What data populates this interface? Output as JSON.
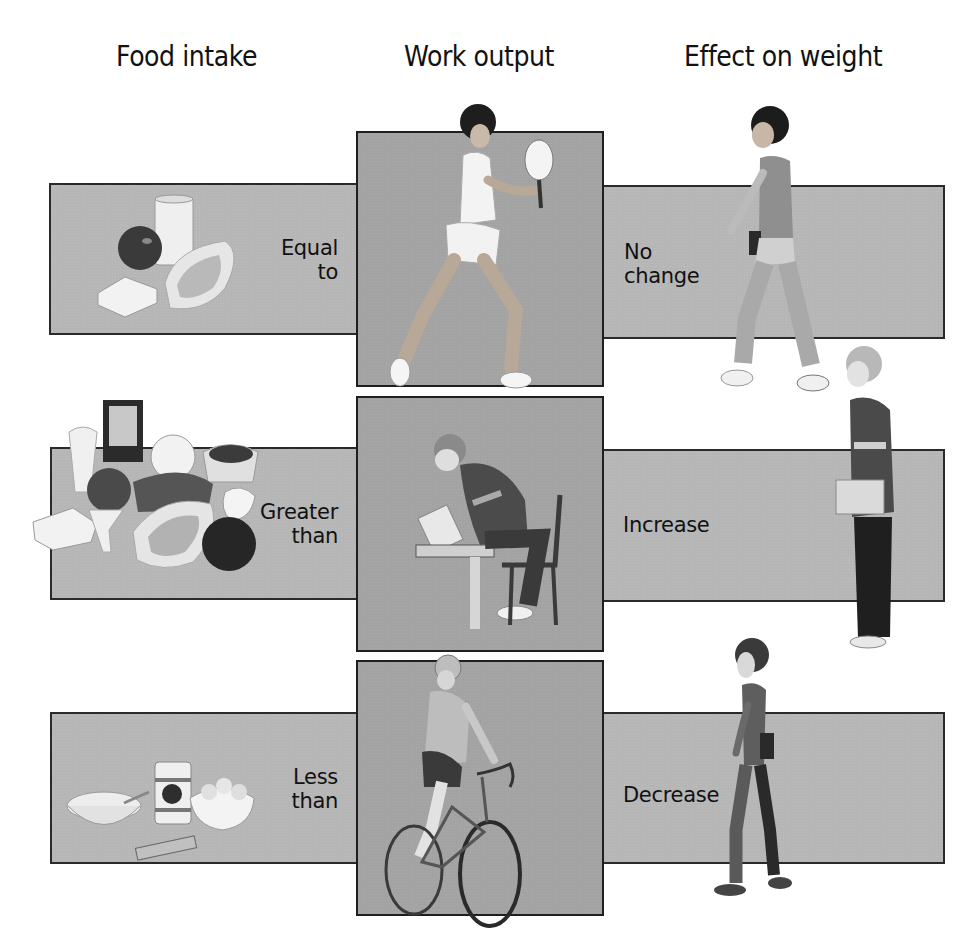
{
  "headers": {
    "food_intake": "Food intake",
    "work_output": "Work output",
    "effect_on_weight": "Effect on weight"
  },
  "rows": [
    {
      "intake_label_line1": "Equal",
      "intake_label_line2": "to",
      "food_illustration": "apple-milk-bread-steak",
      "activity_illustration": "tennis-player",
      "effect_label_line1": "No",
      "effect_label_line2": "change",
      "effect_illustration": "walking-man-normal"
    },
    {
      "intake_label_line1": "Greater",
      "intake_label_line2": "than",
      "food_illustration": "large-food-assortment",
      "activity_illustration": "student-reading-at-desk",
      "effect_label_line1": "Increase",
      "effect_label_line2": "",
      "effect_illustration": "heavier-man-standing"
    },
    {
      "intake_label_line1": "Less",
      "intake_label_line2": "than",
      "food_illustration": "cereal-can-popcorn-candy",
      "activity_illustration": "cyclist",
      "effect_label_line1": "Decrease",
      "effect_label_line2": "",
      "effect_illustration": "thinner-person-walking"
    }
  ],
  "colors": {
    "side_box": "#b6b6b6",
    "middle_box": "#a3a3a3",
    "border": "#222222",
    "text": "#111111"
  }
}
